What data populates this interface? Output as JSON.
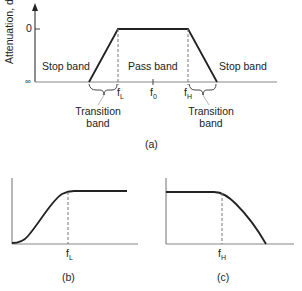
{
  "figure_a": {
    "caption": "(a)",
    "y_axis_label": "Attenuation, dB",
    "y_ticks": {
      "top": "0",
      "bottom": "∞"
    },
    "regions": {
      "stop_band_left": "Stop band",
      "pass_band": "Pass band",
      "stop_band_right": "Stop band"
    },
    "transition_left": {
      "line1": "Transition",
      "line2": "band"
    },
    "transition_right": {
      "line1": "Transition",
      "line2": "band"
    },
    "freq_labels": {
      "f_low": {
        "base": "f",
        "sub": "L"
      },
      "f_center": {
        "base": "f",
        "sub": "0"
      },
      "f_high": {
        "base": "f",
        "sub": "H"
      }
    }
  },
  "figure_b": {
    "caption": "(b)",
    "freq_label": {
      "base": "f",
      "sub": "L"
    }
  },
  "figure_c": {
    "caption": "(c)",
    "freq_label": {
      "base": "f",
      "sub": "H"
    }
  },
  "colors": {
    "line": "#222222",
    "axis": "#555555",
    "dashed": "#666666"
  }
}
